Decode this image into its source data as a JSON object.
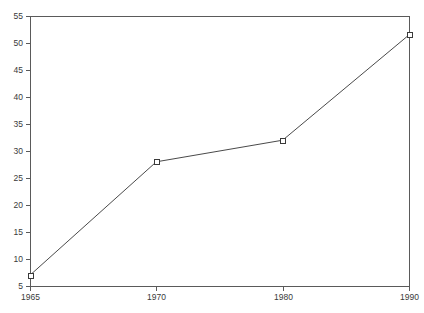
{
  "chart_data": {
    "type": "line",
    "title": "",
    "subtitle": "",
    "xlabel": "",
    "ylabel": "",
    "categories": [
      "1965",
      "1970",
      "1980",
      "1990"
    ],
    "x": [
      1965,
      1970,
      1980,
      1990
    ],
    "values": [
      7,
      28,
      32,
      51.5
    ],
    "series": [
      {
        "name": "",
        "values": [
          7,
          28,
          32,
          51.5
        ]
      }
    ],
    "ylim": [
      5,
      55
    ],
    "yticks": [
      5,
      10,
      15,
      20,
      25,
      30,
      35,
      40,
      45,
      50,
      55
    ],
    "ytick_labels": [
      "5",
      "10",
      "15",
      "20",
      "25",
      "30",
      "35",
      "40",
      "45",
      "50",
      "55"
    ],
    "xtick_labels": [
      "1965",
      "1970",
      "1980",
      "1990"
    ],
    "x_axis_scale": "categorical-even-spacing",
    "grid": false,
    "legend": false,
    "legend_position": "none",
    "marker": "open-square",
    "line_color": "#4a4a4a",
    "marker_fill": "#ffffff",
    "marker_edge_color": "#3a3a3a",
    "axis_color": "#5a5a5a",
    "text_color": "#3a3a3a",
    "background_color": "#ffffff",
    "frame": "full-box",
    "tick_direction": "outward",
    "annotations": []
  },
  "plot_geometry": {
    "left": 30,
    "right": 409,
    "top": 16,
    "bottom": 286
  }
}
